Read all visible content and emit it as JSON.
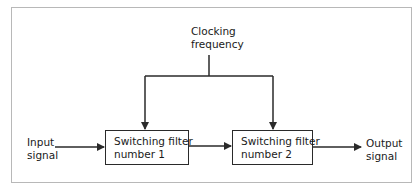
{
  "diagram": {
    "type": "block-diagram",
    "clock": {
      "line1": "Clocking",
      "line2": "frequency"
    },
    "input": {
      "line1": "Input",
      "line2": "signal"
    },
    "output": {
      "line1": "Output",
      "line2": "signal"
    },
    "blocks": [
      {
        "line1": "Switching filter",
        "line2": "number 1"
      },
      {
        "line1": "Switching filter",
        "line2": "number 2"
      }
    ],
    "connections": [
      {
        "from": "Input signal",
        "to": "Switching filter number 1"
      },
      {
        "from": "Switching filter number 1",
        "to": "Switching filter number 2"
      },
      {
        "from": "Switching filter number 2",
        "to": "Output signal"
      },
      {
        "from": "Clocking frequency",
        "to": "Switching filter number 1"
      },
      {
        "from": "Clocking frequency",
        "to": "Switching filter number 2"
      }
    ],
    "colors": {
      "line": "#2a2a2a",
      "frame": "#b8b8b8",
      "background": "#ffffff"
    }
  }
}
